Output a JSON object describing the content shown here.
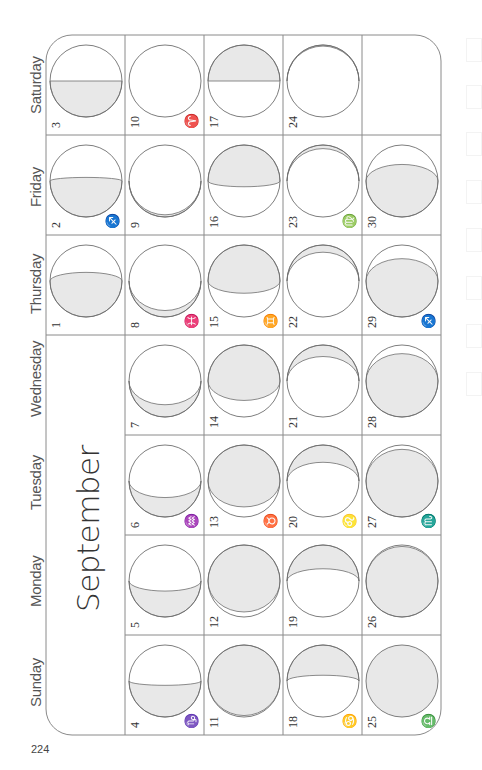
{
  "page": {
    "month": "September",
    "page_number": "224",
    "days_of_week": [
      "Saturday",
      "Friday",
      "Thursday",
      "Wednesday",
      "Tuesday",
      "Monday",
      "Sunday"
    ],
    "colors": {
      "grid": "#8a8a8a",
      "moon_outline": "#6f6f6f",
      "shade": "#e8e8e8",
      "text": "#333333"
    }
  },
  "grid": {
    "left": 46,
    "top": 35,
    "col_width": 79,
    "row_height": 100,
    "corner_radius": 26,
    "weeks": 5,
    "empty_first_week_days": [
      "Wednesday",
      "Tuesday",
      "Monday",
      "Sunday"
    ],
    "empty_last_week_days": [
      "Saturday"
    ]
  },
  "days": [
    {
      "day": 1,
      "weekday": "Thursday",
      "week": 0,
      "zodiac": "",
      "shade": "bottom",
      "f": 0.62
    },
    {
      "day": 2,
      "weekday": "Friday",
      "week": 0,
      "zodiac": "♐",
      "shade": "bottom",
      "f": 0.55
    },
    {
      "day": 3,
      "weekday": "Saturday",
      "week": 0,
      "zodiac": "",
      "shade": "bottom",
      "f": 0.5
    },
    {
      "day": 4,
      "weekday": "Sunday",
      "week": 1,
      "zodiac": "♑",
      "shade": "bottom",
      "f": 0.44
    },
    {
      "day": 5,
      "weekday": "Monday",
      "week": 1,
      "zodiac": "",
      "shade": "bottom",
      "f": 0.36
    },
    {
      "day": 6,
      "weekday": "Tuesday",
      "week": 1,
      "zodiac": "♒",
      "shade": "bottom",
      "f": 0.27
    },
    {
      "day": 7,
      "weekday": "Wednesday",
      "week": 1,
      "zodiac": "",
      "shade": "bottom",
      "f": 0.17
    },
    {
      "day": 8,
      "weekday": "Thursday",
      "week": 1,
      "zodiac": "♓",
      "shade": "bottom",
      "f": 0.09
    },
    {
      "day": 9,
      "weekday": "Friday",
      "week": 1,
      "zodiac": "",
      "shade": "bottom",
      "f": 0.03
    },
    {
      "day": 10,
      "weekday": "Saturday",
      "week": 1,
      "zodiac": "♈",
      "shade": "none",
      "f": 0.0
    },
    {
      "day": 11,
      "weekday": "Sunday",
      "week": 2,
      "zodiac": "",
      "shade": "top",
      "f": 0.02
    },
    {
      "day": 12,
      "weekday": "Monday",
      "week": 2,
      "zodiac": "",
      "shade": "top",
      "f": 0.07
    },
    {
      "day": 13,
      "weekday": "Tuesday",
      "week": 2,
      "zodiac": "♉",
      "shade": "top",
      "f": 0.14
    },
    {
      "day": 14,
      "weekday": "Wednesday",
      "week": 2,
      "zodiac": "",
      "shade": "top",
      "f": 0.23
    },
    {
      "day": 15,
      "weekday": "Thursday",
      "week": 2,
      "zodiac": "♊",
      "shade": "top",
      "f": 0.33
    },
    {
      "day": 16,
      "weekday": "Friday",
      "week": 2,
      "zodiac": "",
      "shade": "top",
      "f": 0.42
    },
    {
      "day": 17,
      "weekday": "Saturday",
      "week": 2,
      "zodiac": "",
      "shade": "top",
      "f": 0.5
    },
    {
      "day": 18,
      "weekday": "Sunday",
      "week": 3,
      "zodiac": "♋",
      "shade": "top",
      "f": 0.58
    },
    {
      "day": 19,
      "weekday": "Monday",
      "week": 3,
      "zodiac": "",
      "shade": "top",
      "f": 0.67
    },
    {
      "day": 20,
      "weekday": "Tuesday",
      "week": 3,
      "zodiac": "♌",
      "shade": "top",
      "f": 0.76
    },
    {
      "day": 21,
      "weekday": "Wednesday",
      "week": 3,
      "zodiac": "",
      "shade": "top",
      "f": 0.84
    },
    {
      "day": 22,
      "weekday": "Thursday",
      "week": 3,
      "zodiac": "",
      "shade": "top",
      "f": 0.9
    },
    {
      "day": 23,
      "weekday": "Friday",
      "week": 3,
      "zodiac": "♍",
      "shade": "top",
      "f": 0.95
    },
    {
      "day": 24,
      "weekday": "Saturday",
      "week": 3,
      "zodiac": "",
      "shade": "top",
      "f": 0.985
    },
    {
      "day": 25,
      "weekday": "Sunday",
      "week": 4,
      "zodiac": "♎",
      "shade": "full",
      "f": 1.0
    },
    {
      "day": 26,
      "weekday": "Monday",
      "week": 4,
      "zodiac": "",
      "shade": "bottom",
      "f": 0.98
    },
    {
      "day": 27,
      "weekday": "Tuesday",
      "week": 4,
      "zodiac": "♏",
      "shade": "bottom",
      "f": 0.94
    },
    {
      "day": 28,
      "weekday": "Wednesday",
      "week": 4,
      "zodiac": "",
      "shade": "bottom",
      "f": 0.88
    },
    {
      "day": 29,
      "weekday": "Thursday",
      "week": 4,
      "zodiac": "♐",
      "shade": "bottom",
      "f": 0.81
    },
    {
      "day": 30,
      "weekday": "Friday",
      "week": 4,
      "zodiac": "",
      "shade": "bottom",
      "f": 0.73
    }
  ]
}
